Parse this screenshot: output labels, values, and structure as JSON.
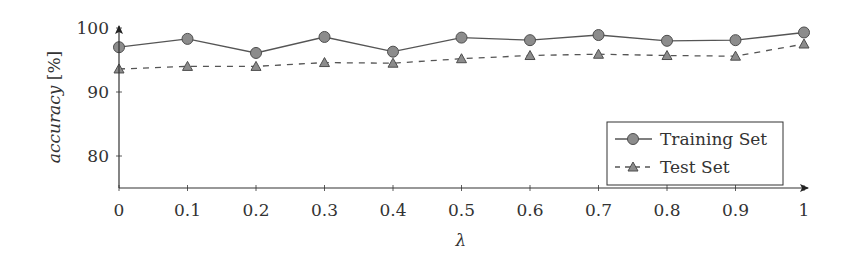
{
  "chart_data": {
    "type": "line",
    "title": "",
    "xlabel": "λ",
    "ylabel": "accuracy [%]",
    "ylabel_parts": {
      "italic": "accuracy",
      "unit": " [%]"
    },
    "x": [
      0,
      0.1,
      0.2,
      0.3,
      0.4,
      0.5,
      0.6,
      0.7,
      0.8,
      0.9,
      1
    ],
    "x_tick_labels": [
      "0",
      "0.1",
      "0.2",
      "0.3",
      "0.4",
      "0.5",
      "0.6",
      "0.7",
      "0.8",
      "0.9",
      "1"
    ],
    "y_tick_labels": [
      "80",
      "90",
      "100"
    ],
    "y_ticks": [
      80,
      90,
      100
    ],
    "xlim": [
      0,
      1
    ],
    "ylim": [
      75,
      100
    ],
    "grid": false,
    "legend_position": "lower right",
    "series": [
      {
        "name": "Training Set",
        "marker": "circle",
        "line_style": "solid",
        "values": [
          97.0,
          98.3,
          96.1,
          98.6,
          96.3,
          98.5,
          98.1,
          98.9,
          98.0,
          98.1,
          99.3
        ]
      },
      {
        "name": "Test Set",
        "marker": "triangle",
        "line_style": "dashed",
        "values": [
          93.6,
          94.0,
          94.0,
          94.6,
          94.5,
          95.2,
          95.7,
          95.9,
          95.7,
          95.6,
          97.5
        ]
      }
    ]
  },
  "colors": {
    "line": "#555555",
    "marker_fill": "#8c8c8c",
    "marker_stroke": "#4d4d4d",
    "axis": "#333333"
  }
}
